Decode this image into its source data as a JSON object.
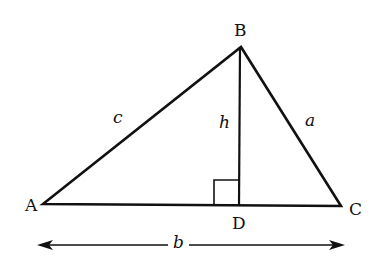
{
  "diagram": {
    "type": "triangle-with-altitude",
    "vertices": {
      "A": {
        "label": "A",
        "x": 43,
        "y": 204
      },
      "B": {
        "label": "B",
        "x": 241,
        "y": 47
      },
      "C": {
        "label": "C",
        "x": 341,
        "y": 206
      },
      "D": {
        "label": "D",
        "x": 239,
        "y": 205
      }
    },
    "sides": {
      "c": {
        "label": "c",
        "from": "A",
        "to": "B"
      },
      "a": {
        "label": "a",
        "from": "B",
        "to": "C"
      },
      "b": {
        "label": "b",
        "from": "A",
        "to": "C"
      }
    },
    "altitude": {
      "label": "h",
      "from": "B",
      "to": "D"
    },
    "right_angle_marker": {
      "at": "D"
    },
    "dimension_arrow": {
      "label": "b",
      "from_x": 38,
      "to_x": 343,
      "y": 245
    },
    "colors": {
      "stroke": "#111111",
      "background": "#ffffff"
    }
  }
}
